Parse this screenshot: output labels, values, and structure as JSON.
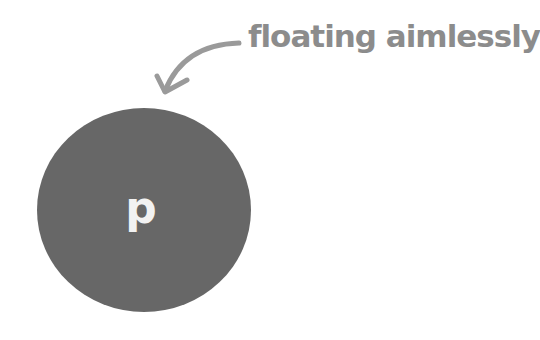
{
  "annotation": {
    "text": "floating aimlessly",
    "color": "#8c8c8c"
  },
  "node": {
    "letter": "p",
    "fill_color": "#676767",
    "text_color": "#f2f2f2"
  },
  "arrow": {
    "icon": "curved-arrow-icon",
    "color": "#8c8c8c"
  }
}
